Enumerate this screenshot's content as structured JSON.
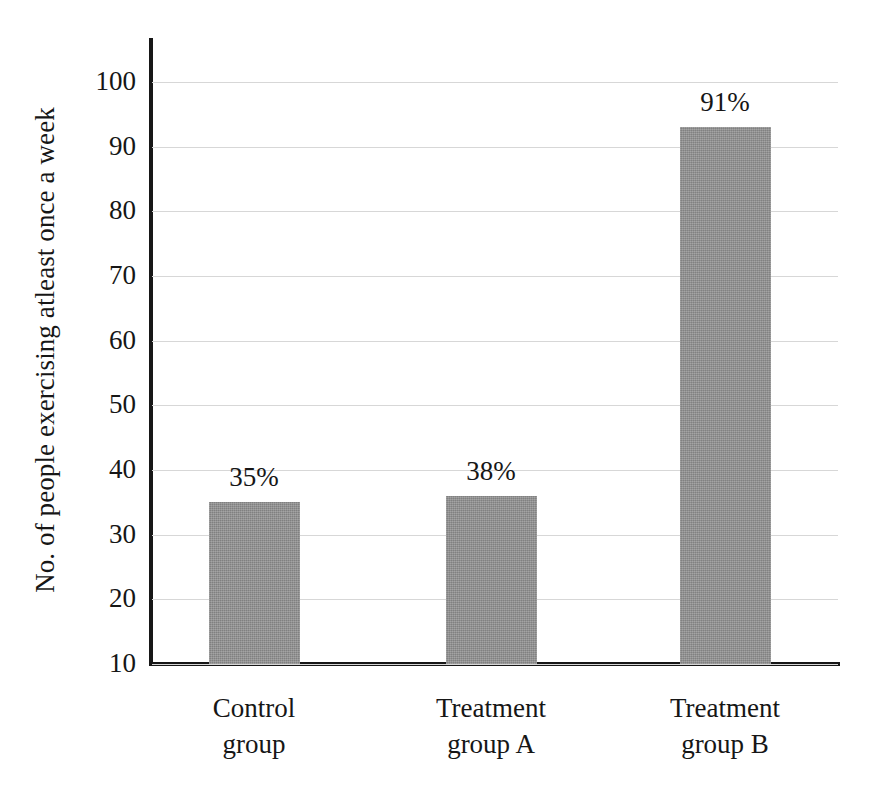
{
  "chart_data": {
    "type": "bar",
    "title": "",
    "subtitle": "",
    "xlabel": "",
    "ylabel": "No. of people exercising atleast once a week",
    "ylim": [
      10,
      100
    ],
    "ytick_labels": [
      "100",
      "90",
      "80",
      "70",
      "60",
      "50",
      "40",
      "30",
      "20",
      "10"
    ],
    "ytick_values": [
      100,
      90,
      80,
      70,
      60,
      50,
      40,
      30,
      20,
      10
    ],
    "grid": true,
    "legend": "none",
    "categories": [
      "Control group",
      "Treatment group A",
      "Treatment group B"
    ],
    "category_lines": [
      {
        "line1": "Control",
        "line2": "group"
      },
      {
        "line1": "Treatment",
        "line2": "group A"
      },
      {
        "line1": "Treatment",
        "line2": "group B"
      }
    ],
    "values": [
      35,
      38,
      91
    ],
    "bar_tops": [
      35,
      36,
      93
    ],
    "data_labels": [
      "35%",
      "38%",
      "91%"
    ],
    "bar_color": "#8d8d8d",
    "axis_color": "#171717",
    "grid_color": "#d7d7d7",
    "background_color": "#ffffff"
  }
}
